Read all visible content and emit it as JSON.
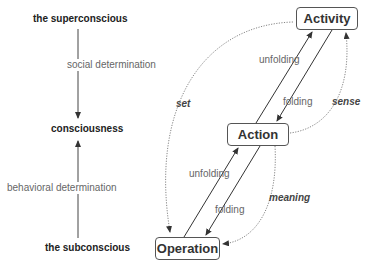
{
  "left_axis": {
    "top_label": "the superconscious",
    "middle_label": "consciousness",
    "bottom_label": "the subconscious",
    "down_arrow_label": "social determination",
    "up_arrow_label": "behavioral determination"
  },
  "nodes": {
    "activity": "Activity",
    "action": "Action",
    "operation": "Operation"
  },
  "edges": {
    "upper_unfolding": "unfolding",
    "upper_folding": "folding",
    "lower_unfolding": "unfolding",
    "lower_folding": "folding",
    "set": "set",
    "sense": "sense",
    "meaning": "meaning"
  },
  "colors": {
    "line": "#444444",
    "dotted": "#777777",
    "label": "#666666"
  }
}
